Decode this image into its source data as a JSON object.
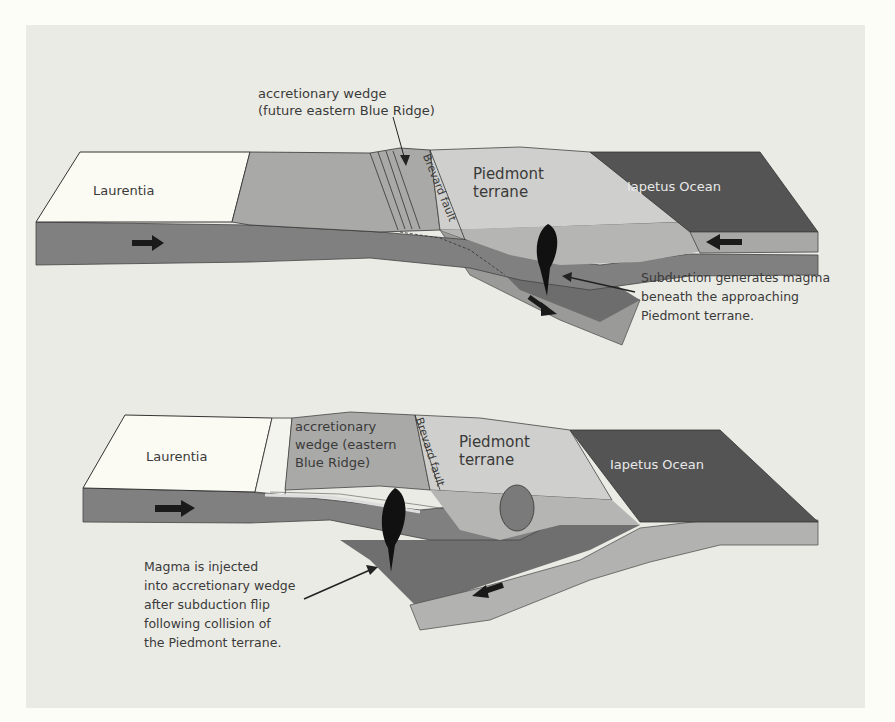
{
  "figure": {
    "background": "#ebebe5",
    "colors": {
      "laurentia": "#fbfbf3",
      "wedge": "#a9a9a7",
      "piedmont": "#cfcfcd",
      "ocean": "#545454",
      "lithosphere": "#7f7f7f",
      "slab_light": "#b7b7b5",
      "mantle_dark": "#6d6d6d",
      "magma": "#111111"
    }
  },
  "top_panel": {
    "callout_wedge": {
      "line1": "accretionary wedge",
      "line2": "(future eastern Blue Ridge)"
    },
    "laurentia": "Laurentia",
    "brevard_fault": "Brevard fault",
    "piedmont": {
      "line1": "Piedmont",
      "line2": "terrane"
    },
    "ocean": "Iapetus Ocean",
    "caption": {
      "line1": "Subduction generates magma",
      "line2": "beneath the approaching",
      "line3": "Piedmont terrane."
    }
  },
  "bottom_panel": {
    "laurentia": "Laurentia",
    "wedge": {
      "line1": "accretionary",
      "line2": "wedge (eastern",
      "line3": "Blue Ridge)"
    },
    "brevard_fault": "Brevard fault",
    "piedmont": {
      "line1": "Piedmont",
      "line2": "terrane"
    },
    "ocean": "Iapetus Ocean",
    "caption": {
      "line1": "Magma is injected",
      "line2": "into accretionary wedge",
      "line3": "after subduction flip",
      "line4": "following collision of",
      "line5": "the Piedmont terrane."
    }
  }
}
